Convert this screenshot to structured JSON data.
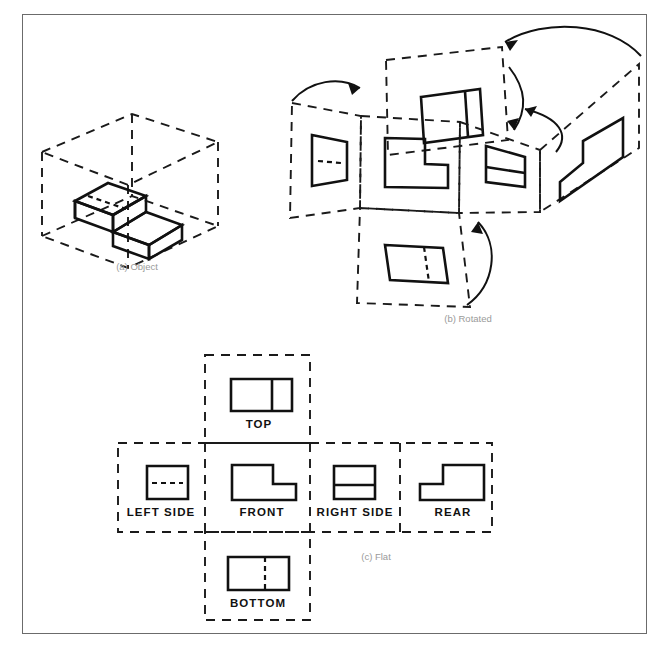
{
  "figure": {
    "border_color": "#6b6b6b",
    "background": "#ffffff",
    "line_color": "#111111",
    "caption_color": "#9a9a9a"
  },
  "panels": [
    {
      "id": "a",
      "caption": "(a) Object"
    },
    {
      "id": "b",
      "caption": "(b) Rotated"
    },
    {
      "id": "c",
      "caption": "(c) Flat"
    }
  ],
  "captions": {
    "a": "(a) Object",
    "b": "(b) Rotated",
    "c": "(c) Flat"
  },
  "flat_view_labels": {
    "top": "TOP",
    "left_side": "LEFT SIDE",
    "front": "FRONT",
    "right_side": "RIGHT SIDE",
    "rear": "REAR",
    "bottom": "BOTTOM"
  },
  "views": [
    {
      "name": "TOP",
      "label": "TOP",
      "shape": "rectangle-with-vertical-divider",
      "divider": "solid",
      "divider_position": 0.66
    },
    {
      "name": "LEFT SIDE",
      "label": "LEFT SIDE",
      "shape": "square-with-horizontal-hidden-line",
      "divider": "dashed",
      "divider_position": 0.5
    },
    {
      "name": "FRONT",
      "label": "FRONT",
      "shape": "L-step-down-right",
      "divider": "none",
      "divider_position": 0
    },
    {
      "name": "RIGHT SIDE",
      "label": "RIGHT SIDE",
      "shape": "square-with-horizontal-divider",
      "divider": "solid",
      "divider_position": 0.55
    },
    {
      "name": "REAR",
      "label": "REAR",
      "shape": "L-step-up-right",
      "divider": "none",
      "divider_position": 0
    },
    {
      "name": "BOTTOM",
      "label": "BOTTOM",
      "shape": "rectangle-with-vertical-divider",
      "divider": "dashed",
      "divider_position": 0.6
    }
  ]
}
